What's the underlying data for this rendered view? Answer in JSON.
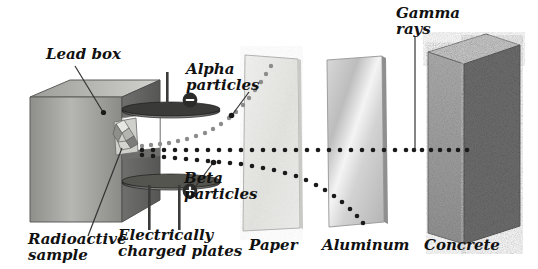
{
  "diagram": {
    "labels": {
      "lead_box": "Lead box",
      "radioactive_sample": "Radioactive\nsample",
      "charged_plates": "Electrically\ncharged plates",
      "alpha": "Alpha\nparticles",
      "beta": "Beta\nparticles",
      "gamma": "Gamma\nrays",
      "paper": "Paper",
      "aluminum": "Aluminum",
      "concrete": "Concrete"
    },
    "plates": {
      "negative_symbol": "−",
      "positive_symbol": "+",
      "negative_position": "top",
      "positive_position": "bottom"
    },
    "beams": [
      {
        "name": "alpha",
        "deflection": "up",
        "stopped_by": "Paper",
        "dot_color": "#8a8a8a"
      },
      {
        "name": "beta",
        "deflection": "down",
        "stopped_by": "Aluminum",
        "dot_color": "#1a1a1a"
      },
      {
        "name": "gamma",
        "deflection": "none",
        "stopped_by": "Concrete",
        "dot_color": "#1a1a1a"
      }
    ],
    "barriers": [
      {
        "name": "Paper",
        "tone": "#e9e9e7"
      },
      {
        "name": "Aluminum",
        "tone": "#cfcfcf"
      },
      {
        "name": "Concrete",
        "tone": "#9a9a9a"
      }
    ],
    "colors": {
      "lead_light": "#b9b9b7",
      "lead_dark": "#6e6e6c",
      "text": "#111111",
      "leader": "#333333"
    }
  }
}
